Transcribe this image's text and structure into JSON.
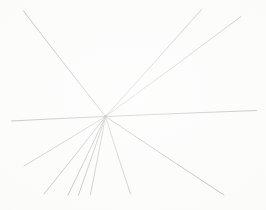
{
  "artwork": {
    "title": "Radiating Lines",
    "medium": "graphite line drawing on paper",
    "canvas_width": 266,
    "canvas_height": 210,
    "background_color": "#fbfbfa",
    "paper_edge_color": "#f2f2f0",
    "line_color": "#a9a9a7",
    "line_color_dark": "#8d8d8b",
    "line_count": 9,
    "vanishing_point": {
      "x": 105.5,
      "y": 116.5
    }
  },
  "lines": [
    {
      "id": "line-upper-left",
      "label": "upper-left diagonal",
      "x1": 23.5,
      "y1": 11.0,
      "x2": 105.5,
      "y2": 116.5,
      "stroke": "#9a9a98",
      "width": 0.85,
      "bow": 0.6
    },
    {
      "id": "line-upper-right-steep",
      "label": "upper-right steep diagonal",
      "x1": 201.5,
      "y1": 9.5,
      "x2": 105.5,
      "y2": 116.5,
      "stroke": "#a5a5a3",
      "width": 0.8,
      "bow": -0.5
    },
    {
      "id": "line-upper-right-shallow",
      "label": "upper-right shallow diagonal",
      "x1": 241.0,
      "y1": 16.5,
      "x2": 105.5,
      "y2": 116.5,
      "stroke": "#a8a8a6",
      "width": 0.8,
      "bow": -0.8
    },
    {
      "id": "line-horizontal-right",
      "label": "near-horizontal line to right edge",
      "x1": 256.5,
      "y1": 110.5,
      "x2": 105.5,
      "y2": 116.5,
      "stroke": "#9f9f9d",
      "width": 0.9,
      "bow": 0.3
    },
    {
      "id": "line-horizontal-left",
      "label": "near-horizontal line to left edge",
      "x1": 11.5,
      "y1": 121.0,
      "x2": 105.5,
      "y2": 116.5,
      "stroke": "#9c9c9a",
      "width": 0.9,
      "bow": -0.3
    },
    {
      "id": "line-lower-left-shallow",
      "label": "lower-left shallow diagonal",
      "x1": 24.0,
      "y1": 166.0,
      "x2": 105.5,
      "y2": 116.5,
      "stroke": "#aaaaa8",
      "width": 0.8,
      "bow": 0.4
    },
    {
      "id": "line-lower-left-a",
      "label": "lower-left diagonal to bottom",
      "x1": 44.0,
      "y1": 194.0,
      "x2": 105.5,
      "y2": 116.5,
      "stroke": "#a3a3a1",
      "width": 0.85,
      "bow": 0.4
    },
    {
      "id": "line-lower-left-b",
      "label": "lower diagonal to bottom left-of-center",
      "x1": 68.0,
      "y1": 195.0,
      "x2": 105.5,
      "y2": 116.5,
      "stroke": "#9e9e9c",
      "width": 0.85,
      "bow": 0.3
    },
    {
      "id": "line-lower-near-vertical",
      "label": "near-vertical line to bottom",
      "x1": 78.5,
      "y1": 195.0,
      "x2": 105.5,
      "y2": 116.5,
      "stroke": "#a0a09e",
      "width": 0.85,
      "bow": 0.25
    },
    {
      "id": "line-lower-center",
      "label": "lower-center diagonal to bottom",
      "x1": 90.5,
      "y1": 194.5,
      "x2": 105.5,
      "y2": 116.5,
      "stroke": "#a4a4a2",
      "width": 0.8,
      "bow": 0.2
    },
    {
      "id": "line-lower-right-steep",
      "label": "lower-right steep diagonal",
      "x1": 130.5,
      "y1": 194.0,
      "x2": 105.5,
      "y2": 116.5,
      "stroke": "#a6a6a4",
      "width": 0.8,
      "bow": -0.3
    },
    {
      "id": "line-lower-right-shallow",
      "label": "lower-right shallow diagonal",
      "x1": 224.0,
      "y1": 195.0,
      "x2": 105.5,
      "y2": 116.5,
      "stroke": "#9d9d9b",
      "width": 0.9,
      "bow": -0.5
    }
  ]
}
